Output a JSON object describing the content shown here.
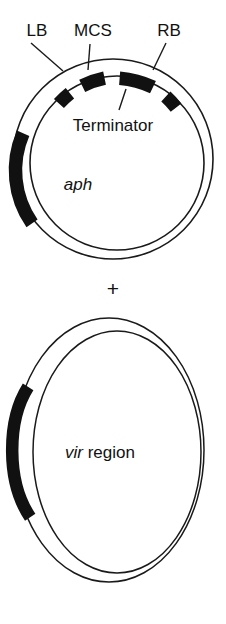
{
  "figure": {
    "plus_symbol": "+",
    "colors": {
      "stroke": "#1a1a1a",
      "segment_fill": "#111111",
      "background": "#ffffff"
    },
    "plasmid_binary": {
      "name": "binary-vector-plasmid",
      "shape": "circle",
      "labels": {
        "lb": "LB",
        "mcs": "MCS",
        "rb": "RB",
        "terminator": "Terminator",
        "aph": "aph"
      },
      "segments": [
        {
          "id": "lb",
          "label": "LB",
          "start_deg": -52,
          "end_deg": -43,
          "filled": true
        },
        {
          "id": "mcs",
          "label": "MCS",
          "start_deg": -38,
          "end_deg": -22,
          "filled": true
        },
        {
          "id": "terminator",
          "label": "Terminator",
          "start_deg": -13,
          "end_deg": 13,
          "filled": true
        },
        {
          "id": "rb",
          "label": "RB",
          "start_deg": 26,
          "end_deg": 38,
          "filled": true
        },
        {
          "id": "aph",
          "label": "aph",
          "start_deg": 196,
          "end_deg": 244,
          "filled": true
        }
      ]
    },
    "plasmid_vir": {
      "name": "vir-helper-plasmid",
      "shape": "ellipse",
      "labels": {
        "vir_italic": "vir",
        "vir_rest": " region"
      },
      "segments": [
        {
          "id": "vir",
          "label": "vir region",
          "start_deg": 196,
          "end_deg": 252,
          "filled": true
        }
      ]
    }
  }
}
